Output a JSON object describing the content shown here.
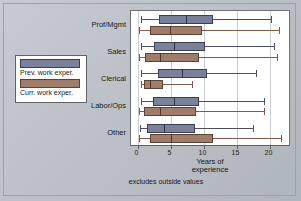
{
  "figure": {
    "xlabel_line1": "Years of",
    "xlabel_line2": "experience",
    "footnote": "excludes outside values"
  },
  "legend": {
    "items": [
      {
        "label": "Prev. work exper.",
        "color": "#7a819c",
        "key": "prev"
      },
      {
        "label": "Curr. work exper.",
        "color": "#9f7d68",
        "key": "curr"
      }
    ]
  },
  "chart_data": {
    "type": "boxplot",
    "title": "",
    "xlabel": "Years of experience",
    "ylabel": "",
    "xlim": [
      0,
      22.5
    ],
    "xticks": [
      0,
      5,
      10,
      15,
      20
    ],
    "xtick_labels": [
      "0",
      "5",
      "10",
      "15",
      "20"
    ],
    "grid": true,
    "orientation": "horizontal",
    "note": "excludes outside values",
    "categories": [
      "Prof/Mgmt",
      "Sales",
      "Clerical",
      "Labor/Ops",
      "Other"
    ],
    "series": [
      {
        "name": "Prev. work exper.",
        "color": "#7a819c",
        "boxes": [
          {
            "category": "Prof/Mgmt",
            "lower_whisker": 0.5,
            "q1": 3.3,
            "median": 7.3,
            "q3": 11.4,
            "upper_whisker": 20.2
          },
          {
            "category": "Sales",
            "lower_whisker": 0.5,
            "q1": 2.5,
            "median": 5.5,
            "q3": 10.3,
            "upper_whisker": 20.7
          },
          {
            "category": "Clerical",
            "lower_whisker": 0.5,
            "q1": 3.1,
            "median": 6.8,
            "q3": 10.6,
            "upper_whisker": 17.9
          },
          {
            "category": "Labor/Ops",
            "lower_whisker": 0.5,
            "q1": 2.3,
            "median": 5.6,
            "q3": 9.3,
            "upper_whisker": 19.2
          },
          {
            "category": "Other",
            "lower_whisker": 0.4,
            "q1": 1.5,
            "median": 4.0,
            "q3": 8.7,
            "upper_whisker": 17.5
          }
        ]
      },
      {
        "name": "Curr. work exper.",
        "color": "#9f7d68",
        "boxes": [
          {
            "category": "Prof/Mgmt",
            "lower_whisker": 0.3,
            "q1": 1.9,
            "median": 4.9,
            "q3": 9.7,
            "upper_whisker": 21.4
          },
          {
            "category": "Sales",
            "lower_whisker": 0.3,
            "q1": 1.2,
            "median": 3.4,
            "q3": 9.3,
            "upper_whisker": 21.2
          },
          {
            "category": "Clerical",
            "lower_whisker": 0.5,
            "q1": 1.0,
            "median": 1.9,
            "q3": 3.9,
            "upper_whisker": 8.2
          },
          {
            "category": "Labor/Ops",
            "lower_whisker": 0.3,
            "q1": 1.0,
            "median": 3.4,
            "q3": 8.8,
            "upper_whisker": 19.2
          },
          {
            "category": "Other",
            "lower_whisker": 0.3,
            "q1": 1.9,
            "median": 5.0,
            "q3": 11.5,
            "upper_whisker": 21.7
          }
        ]
      }
    ]
  }
}
